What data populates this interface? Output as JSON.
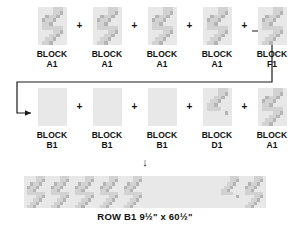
{
  "diagram": {
    "plus_symbol": "+",
    "down_arrow": "↓",
    "caption": "ROW B1 9½\" x 60½\"",
    "block_word": "BLOCK",
    "colors": {
      "background": "#ffffff",
      "text": "#111111",
      "block_light": "#e8e8e8",
      "block_mid": "#d2d2d2",
      "block_dark": "#b4b4b4",
      "connector_line": "#1a1a1a",
      "strip_background": "#e4e4e4"
    },
    "rows": [
      {
        "name": "row-1",
        "cells": [
          {
            "word": "BLOCK",
            "code": "A1",
            "pattern": "zigzag",
            "flip": false
          },
          {
            "word": "BLOCK",
            "code": "A1",
            "pattern": "zigzag",
            "flip": false
          },
          {
            "word": "BLOCK",
            "code": "A1",
            "pattern": "zigzag",
            "flip": false
          },
          {
            "word": "BLOCK",
            "code": "A1",
            "pattern": "zigzag",
            "flip": false
          },
          {
            "word": "BLOCK",
            "code": "F1",
            "pattern": "zigzag",
            "flip": false
          }
        ]
      },
      {
        "name": "row-2",
        "cells": [
          {
            "word": "BLOCK",
            "code": "B1",
            "pattern": "plain",
            "flip": false
          },
          {
            "word": "BLOCK",
            "code": "B1",
            "pattern": "plain",
            "flip": false
          },
          {
            "word": "BLOCK",
            "code": "B1",
            "pattern": "plain",
            "flip": false
          },
          {
            "word": "BLOCK",
            "code": "D1",
            "pattern": "halfzigzag",
            "flip": false
          },
          {
            "word": "BLOCK",
            "code": "A1",
            "pattern": "zigzag",
            "flip": false
          }
        ]
      }
    ],
    "assembled_strip": {
      "name": "row-b1-strip",
      "segments": [
        {
          "code": "A1",
          "pattern": "zigzag"
        },
        {
          "code": "A1",
          "pattern": "zigzag"
        },
        {
          "code": "A1",
          "pattern": "zigzag"
        },
        {
          "code": "A1",
          "pattern": "zigzag"
        },
        {
          "code": "F1",
          "pattern": "zigzag"
        },
        {
          "code": "B1",
          "pattern": "plain"
        },
        {
          "code": "B1",
          "pattern": "plain"
        },
        {
          "code": "B1",
          "pattern": "plain"
        },
        {
          "code": "D1",
          "pattern": "halfzigzag"
        },
        {
          "code": "A1",
          "pattern": "zigzag"
        }
      ]
    }
  }
}
